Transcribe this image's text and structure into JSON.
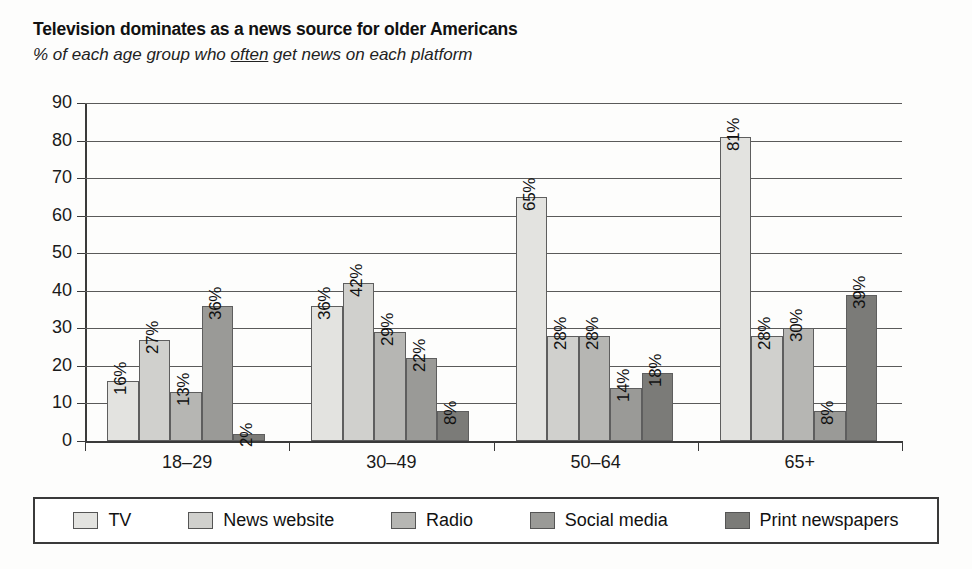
{
  "chart_data": {
    "type": "bar",
    "title": "Television dominates as a news source for older Americans",
    "subtitle_prefix": "% of each age group who ",
    "subtitle_underlined": "often",
    "subtitle_suffix": " get news on each platform",
    "subtitle_full": "% of each age group who often get news on each platform",
    "xlabel": "",
    "ylabel": "",
    "ylim": [
      0,
      90
    ],
    "ytick_values": [
      0,
      10,
      20,
      30,
      40,
      50,
      60,
      70,
      80,
      90
    ],
    "ytick_labels": [
      "0",
      "10",
      "20",
      "30",
      "40",
      "50",
      "60",
      "70",
      "80",
      "90"
    ],
    "grid": true,
    "legend_position": "bottom",
    "categories": [
      "18–29",
      "30–49",
      "50–64",
      "65+"
    ],
    "series": [
      {
        "name": "TV",
        "color": "#e3e3e0",
        "values": [
          16,
          36,
          65,
          81
        ],
        "labels": [
          "16%",
          "36%",
          "65%",
          "81%"
        ]
      },
      {
        "name": "News website",
        "color": "#d0d0cd",
        "values": [
          27,
          42,
          28,
          28
        ],
        "labels": [
          "27%",
          "42%",
          "28%",
          "28%"
        ]
      },
      {
        "name": "Radio",
        "color": "#b6b6b3",
        "values": [
          13,
          29,
          28,
          30
        ],
        "labels": [
          "13%",
          "29%",
          "28%",
          "30%"
        ]
      },
      {
        "name": "Social media",
        "color": "#9a9a97",
        "values": [
          36,
          22,
          14,
          8
        ],
        "labels": [
          "36%",
          "22%",
          "14%",
          "8%"
        ]
      },
      {
        "name": "Print newspapers",
        "color": "#7b7b78",
        "values": [
          2,
          8,
          18,
          39
        ],
        "labels": [
          "2%",
          "8%",
          "18%",
          "39%"
        ]
      }
    ]
  },
  "legend": {
    "items": [
      {
        "label": "TV"
      },
      {
        "label": "News website"
      },
      {
        "label": "Radio"
      },
      {
        "label": "Social media"
      },
      {
        "label": "Print newspapers"
      }
    ]
  }
}
